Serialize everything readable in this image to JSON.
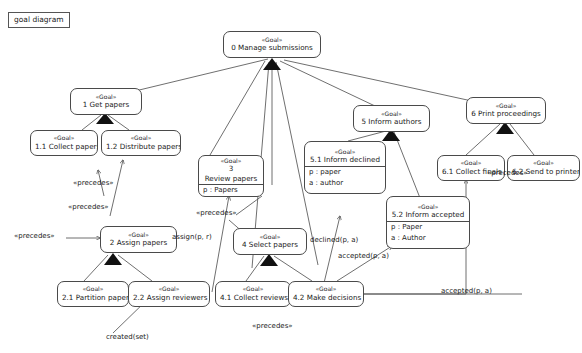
{
  "diagram": {
    "frame_label": "goal diagram",
    "stereotype": "«Goal»",
    "colors": {
      "stroke": "#4a4a4a",
      "text": "#1a1a1a",
      "background": "#ffffff"
    }
  },
  "nodes": [
    {
      "id": "n0",
      "stereotype": "«Goal»",
      "name": "0  Manage submissions",
      "attrs": []
    },
    {
      "id": "n1",
      "stereotype": "«Goal»",
      "name": "1  Get papers",
      "attrs": []
    },
    {
      "id": "n11",
      "stereotype": "«Goal»",
      "name": "1.1  Collect papers",
      "attrs": []
    },
    {
      "id": "n12",
      "stereotype": "«Goal»",
      "name": "1.2  Distribute papers",
      "attrs": []
    },
    {
      "id": "n2",
      "stereotype": "«Goal»",
      "name": "2  Assign papers",
      "attrs": []
    },
    {
      "id": "n21",
      "stereotype": "«Goal»",
      "name": "2.1  Partition papers",
      "attrs": []
    },
    {
      "id": "n22",
      "stereotype": "«Goal»",
      "name": "2.2  Assign reviewers",
      "attrs": []
    },
    {
      "id": "n3",
      "stereotype": "«Goal»",
      "name_line1": "3",
      "name_line2": "Review papers",
      "attrs": [
        "p : Papers"
      ]
    },
    {
      "id": "n4",
      "stereotype": "«Goal»",
      "name": "4  Select papers",
      "attrs": []
    },
    {
      "id": "n41",
      "stereotype": "«Goal»",
      "name": "4.1  Collect reviews",
      "attrs": []
    },
    {
      "id": "n42",
      "stereotype": "«Goal»",
      "name": "4.2  Make decisions",
      "attrs": []
    },
    {
      "id": "n5",
      "stereotype": "«Goal»",
      "name": "5  Inform authors",
      "attrs": []
    },
    {
      "id": "n51",
      "stereotype": "«Goal»",
      "name": "5.1  Inform declined",
      "attrs": [
        "p : paper",
        "a : author"
      ]
    },
    {
      "id": "n52",
      "stereotype": "«Goal»",
      "name": "5.2  Inform accepted",
      "attrs": [
        "p : Paper",
        "a : Author"
      ]
    },
    {
      "id": "n6",
      "stereotype": "«Goal»",
      "name": "6  Print proceedings",
      "attrs": []
    },
    {
      "id": "n61",
      "stereotype": "«Goal»",
      "name": "6.1  Collect finals",
      "attrs": []
    },
    {
      "id": "n62",
      "stereotype": "«Goal»",
      "name": "6.2  Send to printer",
      "attrs": []
    }
  ],
  "edge_labels": [
    {
      "id": "el1",
      "text": "«precedes»"
    },
    {
      "id": "el2",
      "text": "«precedes»"
    },
    {
      "id": "el3",
      "text": "«precedes»"
    },
    {
      "id": "el4",
      "text": "«precedes»"
    },
    {
      "id": "el5",
      "text": "«precedes»"
    },
    {
      "id": "el6",
      "text": "«precedes»"
    },
    {
      "id": "el7",
      "text": "assign(p, r)"
    },
    {
      "id": "el8",
      "text": "created(set)"
    },
    {
      "id": "el9",
      "text": "declined(p, a)"
    },
    {
      "id": "el10",
      "text": "accepted(p, a)"
    },
    {
      "id": "el11",
      "text": "accepted(p, a)"
    }
  ]
}
